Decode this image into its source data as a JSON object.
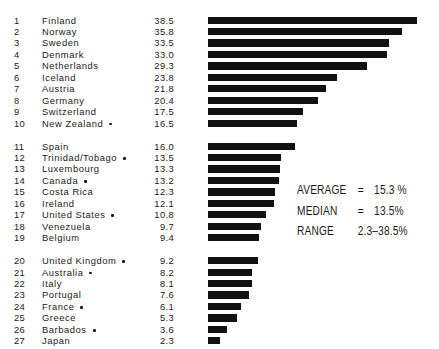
{
  "chart_data": {
    "type": "bar",
    "orientation": "horizontal",
    "title": "",
    "xlabel": "",
    "ylabel": "",
    "xlim": [
      0,
      38.5
    ],
    "grid": false,
    "legend": null,
    "value_suffix": "%",
    "categories": [
      "Finland",
      "Norway",
      "Sweden",
      "Denmark",
      "Netherlands",
      "Iceland",
      "Austria",
      "Germany",
      "Switzerland",
      "New Zealand",
      "Spain",
      "Trinidad/Tobago",
      "Luxembourg",
      "Canada",
      "Costa Rica",
      "Ireland",
      "United States",
      "Venezuela",
      "Belgium",
      "United Kingdom",
      "Australia",
      "Italy",
      "Portugal",
      "France",
      "Greece",
      "Barbados",
      "Japan"
    ],
    "values": [
      38.5,
      35.8,
      33.5,
      33.0,
      29.3,
      23.8,
      21.8,
      20.4,
      17.5,
      16.5,
      16.0,
      13.5,
      13.3,
      13.2,
      12.3,
      12.1,
      10.8,
      9.7,
      9.4,
      9.2,
      8.2,
      8.1,
      7.6,
      6.1,
      5.3,
      3.6,
      2.3
    ],
    "annotations": {
      "average": "15.3",
      "median": "13.5",
      "range_min": "2.3",
      "range_max": "38.5"
    }
  },
  "groups": [
    {
      "rows": [
        {
          "rank": "1",
          "name": "Finland",
          "value": "38.5",
          "marker": false
        },
        {
          "rank": "2",
          "name": "Norway",
          "value": "35.8",
          "marker": false
        },
        {
          "rank": "3",
          "name": "Sweden",
          "value": "33.5",
          "marker": false
        },
        {
          "rank": "4",
          "name": "Denmark",
          "value": "33.0",
          "marker": false
        },
        {
          "rank": "5",
          "name": "Netherlands",
          "value": "29.3",
          "marker": false
        },
        {
          "rank": "6",
          "name": "Iceland",
          "value": "23.8",
          "marker": false
        },
        {
          "rank": "7",
          "name": "Austria",
          "value": "21.8",
          "marker": false
        },
        {
          "rank": "8",
          "name": "Germany",
          "value": "20.4",
          "marker": false
        },
        {
          "rank": "9",
          "name": "Switzerland",
          "value": "17.5",
          "marker": false
        },
        {
          "rank": "10",
          "name": "New Zealand",
          "value": "16.5",
          "marker": true
        }
      ]
    },
    {
      "rows": [
        {
          "rank": "11",
          "name": "Spain",
          "value": "16.0",
          "marker": false
        },
        {
          "rank": "12",
          "name": "Trinidad/Tobago",
          "value": "13.5",
          "marker": true
        },
        {
          "rank": "13",
          "name": "Luxembourg",
          "value": "13.3",
          "marker": false
        },
        {
          "rank": "14",
          "name": "Canada",
          "value": "13.2",
          "marker": true
        },
        {
          "rank": "15",
          "name": "Costa Rica",
          "value": "12.3",
          "marker": false
        },
        {
          "rank": "16",
          "name": "Ireland",
          "value": "12.1",
          "marker": false
        },
        {
          "rank": "17",
          "name": "United States",
          "value": "10.8",
          "marker": true
        },
        {
          "rank": "18",
          "name": "Venezuela",
          "value": "9.7",
          "marker": false
        },
        {
          "rank": "19",
          "name": "Belgium",
          "value": "9.4",
          "marker": false
        }
      ]
    },
    {
      "rows": [
        {
          "rank": "20",
          "name": "United Kingdom",
          "value": "9.2",
          "marker": true
        },
        {
          "rank": "21",
          "name": "Australia",
          "value": "8.2",
          "marker": true
        },
        {
          "rank": "22",
          "name": "Italy",
          "value": "8.1",
          "marker": false
        },
        {
          "rank": "23",
          "name": "Portugal",
          "value": "7.6",
          "marker": false
        },
        {
          "rank": "24",
          "name": "France",
          "value": "6.1",
          "marker": true
        },
        {
          "rank": "25",
          "name": "Greece",
          "value": "5.3",
          "marker": false
        },
        {
          "rank": "26",
          "name": "Barbados",
          "value": "3.6",
          "marker": true
        },
        {
          "rank": "27",
          "name": "Japan",
          "value": "2.3",
          "marker": false
        }
      ]
    }
  ],
  "stats": {
    "average_label": "AVERAGE",
    "average_eq": "=",
    "average_value": "15.3 %",
    "median_label": "MEDIAN",
    "median_eq": "=",
    "median_value": "13.5%",
    "range_label": "RANGE",
    "range_eq": "",
    "range_value": "2.3–38.5%"
  },
  "style": {
    "bar_color": "#111111",
    "text_color": "#1a1a1a",
    "background": "#ffffff"
  }
}
